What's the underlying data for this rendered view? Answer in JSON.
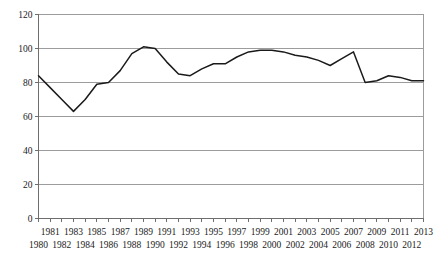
{
  "chart_data": {
    "type": "line",
    "title": "",
    "subtitle": "",
    "xlabel": "",
    "ylabel": "",
    "xlim": [
      1980,
      2013
    ],
    "ylim": [
      0,
      120
    ],
    "yticks": [
      0,
      20,
      40,
      60,
      80,
      100,
      120
    ],
    "ytick_labels": [
      "0",
      "20",
      "40",
      "60",
      "80",
      "100",
      "120"
    ],
    "grid": true,
    "legend": false,
    "legend_position": "none",
    "x_label_rows": {
      "top_row_years": [
        1981,
        1983,
        1985,
        1987,
        1989,
        1991,
        1993,
        1995,
        1997,
        1999,
        2001,
        2003,
        2005,
        2007,
        2009,
        2011,
        2013
      ],
      "bottom_row_years": [
        1980,
        1982,
        1984,
        1986,
        1988,
        1990,
        1992,
        1994,
        1996,
        1998,
        2000,
        2002,
        2004,
        2006,
        2008,
        2010,
        2012
      ]
    },
    "categories": [
      1980,
      1981,
      1982,
      1983,
      1984,
      1985,
      1986,
      1987,
      1988,
      1989,
      1990,
      1991,
      1992,
      1993,
      1994,
      1995,
      1996,
      1997,
      1998,
      1999,
      2000,
      2001,
      2002,
      2003,
      2004,
      2005,
      2006,
      2007,
      2008,
      2009,
      2010,
      2011,
      2012,
      2013
    ],
    "series": [
      {
        "name": "series-1",
        "color": "#1a1a1a",
        "values": [
          84,
          77,
          70,
          63,
          70,
          79,
          80,
          87,
          97,
          101,
          100,
          92,
          85,
          84,
          88,
          91,
          91,
          95,
          98,
          99,
          99,
          98,
          96,
          95,
          93,
          90,
          94,
          98,
          80,
          81,
          84,
          83,
          81,
          81
        ]
      }
    ]
  }
}
